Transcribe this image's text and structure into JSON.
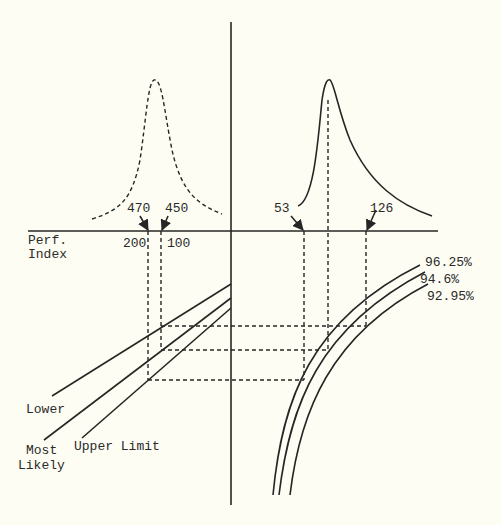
{
  "diagram": {
    "axis_label": [
      "Perf.",
      "Index"
    ],
    "left_distribution": {
      "style": "dashed",
      "markers": [
        {
          "label": "470",
          "axis_value": "200"
        },
        {
          "label": "450",
          "axis_value": "100"
        }
      ]
    },
    "right_distribution": {
      "style": "solid",
      "markers": [
        {
          "label": "53"
        },
        {
          "label": "126"
        }
      ]
    },
    "left_lines": [
      {
        "label": "Lower"
      },
      {
        "label": "Most Likely",
        "lines": [
          "Most",
          "Likely"
        ]
      },
      {
        "label": "Upper Limit"
      }
    ],
    "right_curves": [
      {
        "label": "96.25%"
      },
      {
        "label": "94.6%"
      },
      {
        "label": "92.95%"
      }
    ],
    "colors": {
      "ink": "#262626",
      "paper": "#fdfdf3"
    }
  }
}
